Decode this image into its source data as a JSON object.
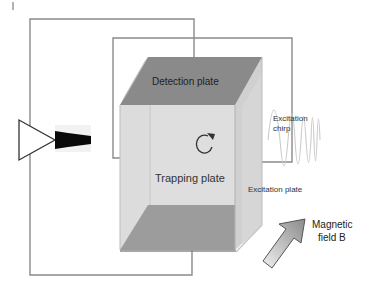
{
  "diagram": {
    "title": "",
    "labels": {
      "detection_plate": "Detection plate",
      "trapping_plate": "Trapping plate",
      "excitation_plate": "Excitation plate",
      "excitation_chirp_line1": "Excitation",
      "excitation_chirp_line2": "chirp",
      "magnetic_field_line1": "Magnetic",
      "magnetic_field_line2": "field B"
    },
    "components": [
      {
        "name": "detection-plate",
        "type": "plate"
      },
      {
        "name": "trapping-plate",
        "type": "plate"
      },
      {
        "name": "excitation-plate",
        "type": "plate"
      },
      {
        "name": "amplifier",
        "type": "triangle"
      },
      {
        "name": "detected-signal",
        "type": "decaying-signal"
      },
      {
        "name": "excitation-chirp",
        "type": "waveform"
      },
      {
        "name": "ion-orbit",
        "type": "circular-arrow"
      },
      {
        "name": "magnetic-field-arrow",
        "type": "arrow"
      }
    ],
    "colors": {
      "wire": "#8a8a8a",
      "top_plate": "#8c8c8c",
      "bottom_plate": "#9a9a9a",
      "box_face": "#d9d9d9",
      "side_face": "#cfcfcf"
    }
  }
}
